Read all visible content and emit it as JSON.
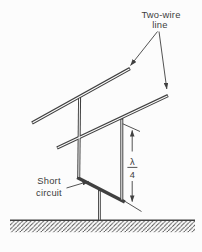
{
  "meta": {
    "figure_kind": "transmission-line diagram",
    "background": "#fcfcfc",
    "ink": "#404040",
    "text_color": "#3d3d3d"
  },
  "labels": {
    "two_wire_line": {
      "line1": "Two-wire",
      "line2": "line"
    },
    "short_circuit": {
      "line1": "Short",
      "line2": "circuit"
    },
    "quarter_wave": {
      "numerator": "λ",
      "denominator": "4"
    }
  }
}
